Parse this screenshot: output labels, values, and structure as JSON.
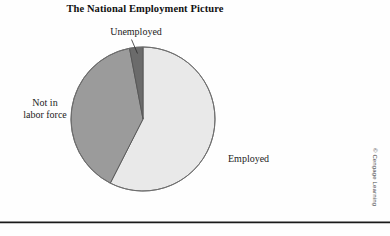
{
  "figure": {
    "title": "The National Employment Picture",
    "credit": "© Cengage Learning"
  },
  "labels": {
    "unemployed": "Unemployed",
    "not_in_labor_force_line1": "Not in",
    "not_in_labor_force_line2": "labor force",
    "employed": "Employed"
  },
  "colors": {
    "employed_fill": "#e9e9e9",
    "not_in_labor_force_fill": "#9b9b9b",
    "unemployed_fill": "#6b6b6b",
    "outline": "#555555",
    "rule": "#1a1a1a",
    "background": "#fefefe",
    "text": "#1a1a1a"
  },
  "chart_data": {
    "type": "pie",
    "title": "The National Employment Picture",
    "categories": [
      "Employed",
      "Not in labor force",
      "Unemployed"
    ],
    "values": [
      57.5,
      39.5,
      3.0
    ],
    "units": "percent of population",
    "slice_colors": [
      "#e9e9e9",
      "#9b9b9b",
      "#6b6b6b"
    ],
    "start_angle_deg": 0,
    "direction": "clockwise",
    "geometry": {
      "center_x": 143,
      "center_y": 119,
      "radius": 72,
      "boundary_angles_deg": [
        0,
        207,
        350,
        360
      ]
    },
    "legend": "none",
    "labels_position": "outside callouts",
    "annotations": [
      {
        "text": "Unemployed",
        "target": "Unemployed",
        "leader_line": true
      },
      {
        "text": "Not in labor force",
        "target": "Not in labor force",
        "leader_line": false
      },
      {
        "text": "Employed",
        "target": "Employed",
        "leader_line": false
      }
    ],
    "grid": false,
    "xlabel": "",
    "ylabel": ""
  }
}
